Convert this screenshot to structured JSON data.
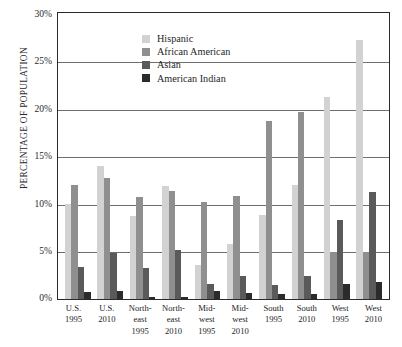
{
  "chart_data": {
    "type": "bar",
    "title": "",
    "xlabel": "",
    "ylabel": "PERCENTAGE OF POPULATION",
    "ylim": [
      0,
      30
    ],
    "ytick_labels": [
      "30%",
      "25%",
      "20%",
      "15%",
      "10%",
      "5%",
      "0%"
    ],
    "ytick_values": [
      30,
      25,
      20,
      15,
      10,
      5,
      0
    ],
    "grid": true,
    "legend_position": "top-left-inside",
    "categories": [
      "U.S. 1995",
      "U.S. 2010",
      "Northeast 1995",
      "Northeast 2010",
      "Midwest 1995",
      "Midwest 2010",
      "South 1995",
      "South 2010",
      "West 1995",
      "West 2010"
    ],
    "category_label_lines": [
      [
        "U.S.",
        "1995"
      ],
      [
        "U.S.",
        "2010"
      ],
      [
        "North-",
        "east",
        "1995"
      ],
      [
        "North-",
        "east",
        "2010"
      ],
      [
        "Mid-",
        "west",
        "1995"
      ],
      [
        "Mid-",
        "west",
        "2010"
      ],
      [
        "South",
        "1995"
      ],
      [
        "South",
        "2010"
      ],
      [
        "West",
        "1995"
      ],
      [
        "West",
        "2010"
      ]
    ],
    "series": [
      {
        "name": "Hispanic",
        "color": "#d2d2d2",
        "values": [
          10.0,
          14.0,
          8.7,
          11.9,
          3.6,
          5.8,
          8.9,
          12.0,
          21.3,
          27.3
        ]
      },
      {
        "name": "African American",
        "color": "#8f8f8f",
        "values": [
          12.0,
          12.7,
          10.7,
          11.4,
          10.2,
          10.9,
          18.8,
          19.7,
          5.0,
          5.0
        ]
      },
      {
        "name": "Asian",
        "color": "#5a5a5a",
        "values": [
          3.4,
          4.9,
          3.3,
          5.2,
          1.6,
          2.4,
          1.5,
          2.4,
          8.3,
          11.3
        ]
      },
      {
        "name": "American Indian",
        "color": "#2b2b2b",
        "values": [
          0.7,
          0.8,
          0.2,
          0.2,
          0.9,
          0.6,
          0.5,
          0.5,
          1.6,
          1.8
        ]
      }
    ]
  }
}
